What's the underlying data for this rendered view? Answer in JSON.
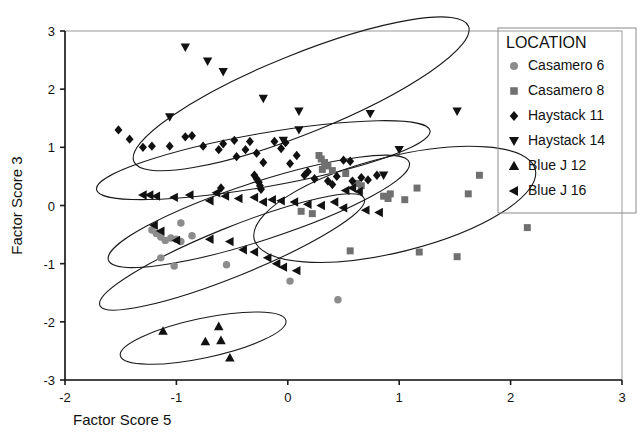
{
  "chart_data": {
    "type": "scatter",
    "title": "",
    "xlabel": "Factor Score 5",
    "ylabel": "Factor Score 3",
    "xlim": [
      -2,
      3
    ],
    "ylim": [
      -3,
      3
    ],
    "xticks": [
      "-2",
      "-1",
      "0",
      "1",
      "2",
      "3"
    ],
    "xtick_values": [
      -2,
      -1,
      0,
      1,
      2,
      3
    ],
    "yticks": [
      "3",
      "2",
      "1",
      "0",
      "-1",
      "-2",
      "-3"
    ],
    "ytick_values": [
      3,
      2,
      1,
      0,
      -1,
      -2,
      -3
    ],
    "grid": false,
    "legend_position": "top-right",
    "legend_title": "LOCATION",
    "series": [
      {
        "name": "Casamero 6",
        "marker": "circle",
        "color": "#8c8c8c",
        "points": [
          [
            -1.22,
            -0.42
          ],
          [
            -1.18,
            -0.48
          ],
          [
            -1.14,
            -0.54
          ],
          [
            -1.1,
            -0.6
          ],
          [
            -1.05,
            -0.56
          ],
          [
            -1.0,
            -0.58
          ],
          [
            -0.96,
            -0.62
          ],
          [
            -1.14,
            -0.9
          ],
          [
            -0.86,
            -0.52
          ],
          [
            -0.96,
            -0.3
          ],
          [
            -1.02,
            -1.04
          ],
          [
            -0.55,
            -1.02
          ],
          [
            0.02,
            -1.3
          ],
          [
            0.45,
            -1.62
          ]
        ]
      },
      {
        "name": "Casamero 8",
        "marker": "square",
        "color": "#707070",
        "points": [
          [
            0.28,
            0.86
          ],
          [
            0.3,
            0.8
          ],
          [
            0.33,
            0.74
          ],
          [
            0.36,
            0.68
          ],
          [
            0.31,
            0.62
          ],
          [
            0.4,
            0.6
          ],
          [
            0.52,
            0.55
          ],
          [
            0.62,
            0.38
          ],
          [
            0.66,
            0.34
          ],
          [
            0.86,
            0.16
          ],
          [
            0.9,
            0.12
          ],
          [
            0.92,
            0.2
          ],
          [
            1.05,
            0.1
          ],
          [
            1.16,
            0.3
          ],
          [
            1.62,
            0.2
          ],
          [
            1.72,
            0.52
          ],
          [
            1.52,
            -0.88
          ],
          [
            1.18,
            -0.8
          ],
          [
            0.56,
            -0.78
          ],
          [
            0.22,
            -0.14
          ],
          [
            0.12,
            -0.1
          ],
          [
            2.15,
            -0.38
          ]
        ]
      },
      {
        "name": "Haystack 11",
        "marker": "diamond",
        "color": "#111111",
        "points": [
          [
            -1.52,
            1.3
          ],
          [
            -1.42,
            1.14
          ],
          [
            -1.3,
            1.0
          ],
          [
            -1.22,
            1.02
          ],
          [
            -1.06,
            1.02
          ],
          [
            -0.92,
            1.18
          ],
          [
            -0.86,
            1.2
          ],
          [
            -0.76,
            1.02
          ],
          [
            -0.62,
            0.96
          ],
          [
            -0.58,
            1.06
          ],
          [
            -0.48,
            1.12
          ],
          [
            -0.46,
            0.84
          ],
          [
            -0.38,
            0.96
          ],
          [
            -0.34,
            1.1
          ],
          [
            -0.28,
            0.9
          ],
          [
            -0.22,
            0.74
          ],
          [
            -0.3,
            0.52
          ],
          [
            -0.28,
            0.46
          ],
          [
            -0.26,
            0.4
          ],
          [
            -0.25,
            0.34
          ],
          [
            -0.24,
            0.28
          ],
          [
            -0.12,
            1.1
          ],
          [
            -0.06,
            0.98
          ],
          [
            -0.02,
            1.08
          ],
          [
            0.08,
            0.86
          ],
          [
            0.15,
            0.52
          ],
          [
            0.18,
            0.58
          ],
          [
            0.24,
            0.46
          ],
          [
            0.36,
            0.42
          ],
          [
            0.44,
            0.5
          ],
          [
            0.5,
            0.78
          ],
          [
            0.56,
            0.76
          ],
          [
            0.58,
            0.42
          ],
          [
            0.66,
            0.48
          ],
          [
            0.72,
            0.44
          ],
          [
            0.8,
            0.52
          ],
          [
            0.4,
            0.36
          ],
          [
            -0.6,
            0.3
          ],
          [
            0.02,
            0.72
          ]
        ]
      },
      {
        "name": "Haystack 14",
        "marker": "triangle-down",
        "color": "#111111",
        "points": [
          [
            -0.92,
            2.72
          ],
          [
            -0.72,
            2.48
          ],
          [
            -0.58,
            2.3
          ],
          [
            -0.22,
            1.84
          ],
          [
            -1.06,
            1.52
          ],
          [
            0.1,
            1.62
          ],
          [
            0.1,
            1.3
          ],
          [
            0.74,
            1.58
          ],
          [
            1.52,
            1.62
          ],
          [
            1.0,
            0.96
          ],
          [
            0.86,
            0.52
          ],
          [
            -0.04,
            1.12
          ]
        ]
      },
      {
        "name": "Blue J 12",
        "marker": "triangle-up",
        "color": "#111111",
        "points": [
          [
            -1.12,
            -2.16
          ],
          [
            -0.62,
            -2.08
          ],
          [
            -0.74,
            -2.34
          ],
          [
            -0.6,
            -2.32
          ],
          [
            -0.52,
            -2.62
          ]
        ]
      },
      {
        "name": "Blue J 16",
        "marker": "triangle-left",
        "color": "#111111",
        "points": [
          [
            -1.3,
            0.18
          ],
          [
            -1.24,
            0.18
          ],
          [
            -1.18,
            0.16
          ],
          [
            -1.02,
            0.14
          ],
          [
            -0.88,
            0.18
          ],
          [
            -0.7,
            0.08
          ],
          [
            -0.64,
            0.22
          ],
          [
            -0.56,
            0.16
          ],
          [
            -0.44,
            0.12
          ],
          [
            -0.3,
            0.14
          ],
          [
            -0.22,
            0.06
          ],
          [
            -0.14,
            0.1
          ],
          [
            -0.06,
            0.08
          ],
          [
            0.06,
            0.06
          ],
          [
            0.18,
            0.02
          ],
          [
            0.3,
            0.0
          ],
          [
            0.42,
            0.06
          ],
          [
            0.52,
            0.26
          ],
          [
            0.58,
            0.3
          ],
          [
            0.64,
            0.24
          ],
          [
            0.7,
            -0.08
          ],
          [
            0.82,
            -0.12
          ],
          [
            -1.14,
            -0.44
          ],
          [
            -1.0,
            -0.6
          ],
          [
            -0.7,
            -0.58
          ],
          [
            -0.52,
            -0.62
          ],
          [
            -0.4,
            -0.76
          ],
          [
            -0.3,
            -0.8
          ],
          [
            -0.18,
            -0.9
          ],
          [
            -0.1,
            -1.0
          ],
          [
            -0.04,
            -1.06
          ],
          [
            0.08,
            -1.12
          ],
          [
            -1.2,
            -0.34
          ],
          [
            0.5,
            -0.04
          ]
        ]
      }
    ],
    "ellipses": [
      {
        "name": "haystack14-ellipse",
        "cx": 0.12,
        "cy": 1.92,
        "rx": 1.62,
        "ry": 0.68,
        "rot": -22
      },
      {
        "name": "haystack11-ellipse",
        "cx": -0.22,
        "cy": 0.78,
        "rx": 1.52,
        "ry": 0.46,
        "rot": -10
      },
      {
        "name": "bluej16-ellipse",
        "cx": -0.26,
        "cy": -0.1,
        "rx": 1.42,
        "ry": 0.5,
        "rot": -18
      },
      {
        "name": "casamero6-ellipse",
        "cx": -0.5,
        "cy": -0.8,
        "rx": 1.28,
        "ry": 0.42,
        "rot": -22
      },
      {
        "name": "casamero8-ellipse",
        "cx": 0.96,
        "cy": 0.02,
        "rx": 1.3,
        "ry": 0.82,
        "rot": -14
      },
      {
        "name": "bluej12-ellipse",
        "cx": -0.76,
        "cy": -2.28,
        "rx": 0.76,
        "ry": 0.34,
        "rot": -12
      }
    ]
  },
  "legend": {
    "title": "LOCATION",
    "items": [
      {
        "label": "Casamero 6",
        "marker": "circle",
        "color": "#8c8c8c"
      },
      {
        "label": "Casamero 8",
        "marker": "square",
        "color": "#707070"
      },
      {
        "label": "Haystack 11",
        "marker": "diamond",
        "color": "#111111"
      },
      {
        "label": "Haystack 14",
        "marker": "triangle-down",
        "color": "#111111"
      },
      {
        "label": "Blue J 12",
        "marker": "triangle-up",
        "color": "#111111"
      },
      {
        "label": "Blue J 16",
        "marker": "triangle-left",
        "color": "#111111"
      }
    ]
  }
}
